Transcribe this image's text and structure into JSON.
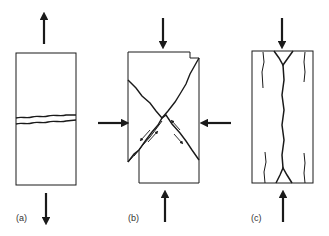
{
  "figure": {
    "colors": {
      "stroke": "#1a1a1a",
      "background": "#ffffff",
      "label": "#333333"
    },
    "panels": [
      {
        "id": "a",
        "label": "(a)",
        "loading": "uniaxial tension",
        "feature": "horizontal tensile fracture"
      },
      {
        "id": "b",
        "label": "(b)",
        "loading": "compression with lateral confinement",
        "feature": "conjugate shear fractures"
      },
      {
        "id": "c",
        "label": "(c)",
        "loading": "uniaxial compression",
        "feature": "axial splitting fractures"
      }
    ]
  }
}
